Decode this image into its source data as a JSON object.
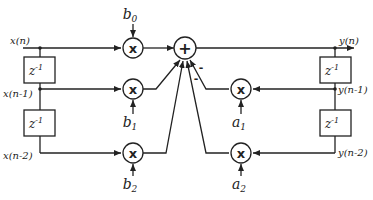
{
  "diagram": {
    "type": "block-diagram",
    "inputs": {
      "x_n": "x(n)",
      "x_n1": "x(n-1)",
      "x_n2": "x(n-2)"
    },
    "outputs": {
      "y_n": "y(n)",
      "y_n1": "y(n-1)",
      "y_n2": "y(n-2)"
    },
    "delay_label": "z",
    "delay_exponent": "-1",
    "multiplier_symbol": "x",
    "adder_symbol": "+",
    "minus_sign": "-",
    "coefficients": {
      "b0": {
        "base": "b",
        "sub": "0"
      },
      "b1": {
        "base": "b",
        "sub": "1"
      },
      "b2": {
        "base": "b",
        "sub": "2"
      },
      "a1": {
        "base": "a",
        "sub": "1"
      },
      "a2": {
        "base": "a",
        "sub": "2"
      }
    },
    "colors": {
      "stroke": "#222222",
      "background": "#ffffff"
    }
  }
}
